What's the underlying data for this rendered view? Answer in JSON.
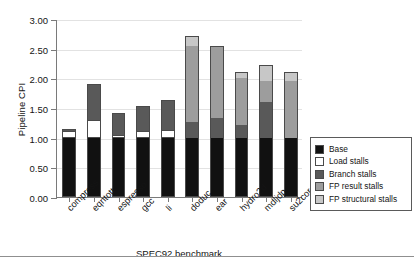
{
  "chart_data": {
    "type": "bar",
    "subtype": "stacked-bar",
    "title": "",
    "xlabel": "SPEC92 benchmark",
    "ylabel": "Pipeline CPI",
    "ylim": [
      0.0,
      3.0
    ],
    "ytick_step": 0.5,
    "ytick_labels": [
      "0.00",
      "0.50",
      "1.00",
      "1.50",
      "2.00",
      "2.50",
      "3.00"
    ],
    "ytick_values": [
      0.0,
      0.5,
      1.0,
      1.5,
      2.0,
      2.5,
      3.0
    ],
    "grid": true,
    "grid_axis": "y",
    "legend_position": "right",
    "categories": [
      "compress",
      "eqntott",
      "espresso",
      "gcc",
      "li",
      "doduc",
      "ear",
      "hydro2d",
      "mdljdp",
      "su2cor"
    ],
    "series": [
      {
        "name": "Base",
        "color": "#111111",
        "values": [
          1.0,
          1.0,
          1.0,
          1.0,
          1.0,
          1.0,
          1.0,
          1.0,
          1.0,
          1.0
        ]
      },
      {
        "name": "Load stalls",
        "color": "#ffffff",
        "values": [
          0.12,
          0.29,
          0.04,
          0.11,
          0.13,
          0.0,
          0.0,
          0.0,
          0.0,
          0.0
        ]
      },
      {
        "name": "Branch stalls",
        "color": "#595959",
        "values": [
          0.03,
          0.62,
          0.38,
          0.42,
          0.5,
          0.27,
          0.33,
          0.22,
          0.6,
          0.0
        ]
      },
      {
        "name": "FP result stalls",
        "color": "#9d9d9d",
        "values": [
          0.0,
          0.0,
          0.0,
          0.0,
          0.0,
          1.28,
          1.22,
          0.78,
          0.36,
          0.95
        ]
      },
      {
        "name": "FP structural stalls",
        "color": "#c7c7c7",
        "values": [
          0.0,
          0.0,
          0.0,
          0.0,
          0.0,
          0.17,
          0.0,
          0.1,
          0.26,
          0.15
        ]
      }
    ],
    "totals": [
      1.15,
      1.91,
      1.42,
      1.53,
      1.63,
      2.72,
      2.55,
      2.1,
      2.22,
      2.1
    ]
  },
  "axes": {
    "y_title": "Pipeline CPI",
    "x_title": "SPEC92 benchmark"
  },
  "legend": {
    "items": [
      {
        "label": "Base",
        "swatch": "base"
      },
      {
        "label": "Load stalls",
        "swatch": "load"
      },
      {
        "label": "Branch stalls",
        "swatch": "branch"
      },
      {
        "label": "FP result stalls",
        "swatch": "fpres"
      },
      {
        "label": "FP structural stalls",
        "swatch": "fpstr"
      }
    ]
  }
}
